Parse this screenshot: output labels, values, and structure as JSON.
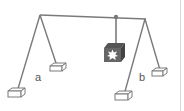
{
  "diagram": {
    "labels": {
      "a": "a",
      "b": "b"
    },
    "colors": {
      "line": "#7a7a7a",
      "box": "#666666",
      "background": "#ffffff"
    }
  }
}
